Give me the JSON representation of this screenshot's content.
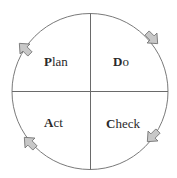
{
  "diagram": {
    "type": "PDCA cycle",
    "quadrants": [
      {
        "position": "top-left",
        "initial": "P",
        "rest": "lan",
        "label": "Plan"
      },
      {
        "position": "top-right",
        "initial": "D",
        "rest": "o",
        "label": "Do"
      },
      {
        "position": "bottom-right",
        "initial": "C",
        "rest": "heck",
        "label": "Check"
      },
      {
        "position": "bottom-left",
        "initial": "A",
        "rest": "ct",
        "label": "Act"
      }
    ],
    "arrows": [
      {
        "name": "plan-to-do",
        "direction": "up-right"
      },
      {
        "name": "do-to-check",
        "direction": "down-right"
      },
      {
        "name": "check-to-act",
        "direction": "down-left"
      },
      {
        "name": "act-to-plan",
        "direction": "up-left"
      }
    ],
    "colors": {
      "stroke": "#7a7a7a",
      "arrow_fill": "#c8c8c8",
      "arrow_stroke": "#6e6e6e",
      "text": "#2a2a2a"
    }
  }
}
